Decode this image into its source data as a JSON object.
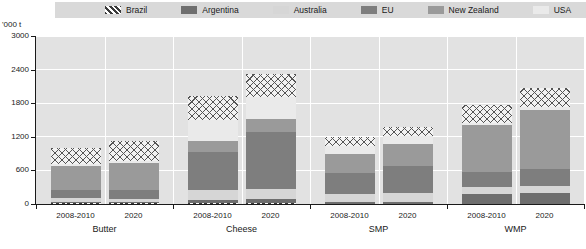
{
  "unit_label": "'000 t",
  "legend": {
    "items": [
      {
        "label": "Brazil",
        "pattern": "diagonal-hatch",
        "color": "#3a3a3a"
      },
      {
        "label": "Argentina",
        "pattern": "solid",
        "color": "#6e6e6e"
      },
      {
        "label": "Australia",
        "pattern": "solid",
        "color": "#d6d6d6"
      },
      {
        "label": "EU",
        "pattern": "solid",
        "color": "#7e7e7e"
      },
      {
        "label": "New Zealand",
        "pattern": "solid",
        "color": "#9a9a9a"
      },
      {
        "label": "USA",
        "pattern": "solid",
        "color": "#eaeaea"
      },
      {
        "label": "Rest of World",
        "pattern": "cross-hatch",
        "color": "#555555"
      }
    ]
  },
  "chart_data": {
    "type": "bar",
    "stacked": true,
    "title": "",
    "xlabel": "",
    "ylabel": "'000 t",
    "ylim": [
      0,
      3000
    ],
    "yticks": [
      0,
      600,
      1200,
      1800,
      2400,
      3000
    ],
    "grid": true,
    "legend_position": "top",
    "groups": [
      "Butter",
      "Cheese",
      "SMP",
      "WMP"
    ],
    "categories": [
      "2008-2010",
      "2020",
      "2008-2010",
      "2020",
      "2008-2010",
      "2020",
      "2008-2010",
      "2020"
    ],
    "series": [
      {
        "name": "Brazil",
        "values": [
          10,
          10,
          20,
          25,
          5,
          5,
          5,
          5
        ]
      },
      {
        "name": "Argentina",
        "values": [
          30,
          30,
          50,
          60,
          25,
          30,
          180,
          200
        ]
      },
      {
        "name": "Australia",
        "values": [
          60,
          55,
          180,
          190,
          150,
          160,
          120,
          120
        ]
      },
      {
        "name": "EU",
        "values": [
          150,
          160,
          680,
          1010,
          380,
          480,
          270,
          300
        ]
      },
      {
        "name": "New Zealand",
        "values": [
          430,
          480,
          190,
          230,
          340,
          390,
          830,
          1060
        ]
      },
      {
        "name": "USA",
        "values": [
          30,
          40,
          380,
          400,
          130,
          150,
          40,
          45
        ]
      },
      {
        "name": "Rest of World",
        "values": [
          290,
          350,
          430,
          405,
          170,
          160,
          325,
          340
        ]
      }
    ],
    "bar_totals": [
      1000,
      1125,
      1930,
      2320,
      1200,
      1375,
      1770,
      2070
    ]
  }
}
